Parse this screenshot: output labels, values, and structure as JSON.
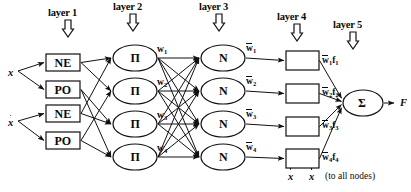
{
  "figure": {
    "type": "neural-network-diagram",
    "width": 411,
    "height": 192,
    "background": "#ffffff",
    "stroke": "#111111"
  },
  "layer_labels": [
    {
      "text": "layer 1",
      "x": 48,
      "y": 8,
      "arrow_x": 68,
      "arrow_y": 20
    },
    {
      "text": "layer 2",
      "x": 113,
      "y": 2,
      "arrow_x": 133,
      "arrow_y": 14
    },
    {
      "text": "layer 3",
      "x": 199,
      "y": 2,
      "arrow_x": 219,
      "arrow_y": 14
    },
    {
      "text": "layer 4",
      "x": 277,
      "y": 12,
      "arrow_x": 297,
      "arrow_y": 24
    },
    {
      "text": "layer 5",
      "x": 333,
      "y": 20,
      "arrow_x": 353,
      "arrow_y": 32
    }
  ],
  "inputs": [
    {
      "name": "x",
      "label": "x",
      "dot": false,
      "x": 8,
      "y": 68
    },
    {
      "name": "xdot",
      "label": "x",
      "dot": true,
      "x": 8,
      "y": 118
    }
  ],
  "layer1": {
    "name": "fuzzification-layer",
    "node_shape": "rect",
    "nodes": [
      {
        "label": "NE",
        "x": 46,
        "y": 54,
        "w": 34,
        "h": 17
      },
      {
        "label": "PO",
        "x": 46,
        "y": 81,
        "w": 34,
        "h": 17
      },
      {
        "label": "NE",
        "x": 46,
        "y": 105,
        "w": 34,
        "h": 17
      },
      {
        "label": "PO",
        "x": 46,
        "y": 132,
        "w": 34,
        "h": 17
      }
    ]
  },
  "layer2": {
    "name": "rule-product-layer",
    "node_shape": "ellipse",
    "node_label": "Π",
    "nodes": [
      {
        "label": "Π",
        "cx": 135,
        "cy": 58,
        "rx": 22,
        "ry": 13
      },
      {
        "label": "Π",
        "cx": 135,
        "cy": 91,
        "rx": 22,
        "ry": 13
      },
      {
        "label": "Π",
        "cx": 135,
        "cy": 124,
        "rx": 22,
        "ry": 13
      },
      {
        "label": "Π",
        "cx": 135,
        "cy": 157,
        "rx": 22,
        "ry": 13
      }
    ],
    "weights": [
      {
        "base": "w",
        "sub": "1",
        "x": 157,
        "y": 45
      },
      {
        "base": "w",
        "sub": "2",
        "x": 157,
        "y": 78
      },
      {
        "base": "w",
        "sub": "3",
        "x": 157,
        "y": 111
      },
      {
        "base": "w",
        "sub": "4",
        "x": 157,
        "y": 144
      }
    ]
  },
  "layer3": {
    "name": "normalization-layer",
    "node_shape": "ellipse",
    "node_label": "N",
    "nodes": [
      {
        "label": "N",
        "cx": 223,
        "cy": 58,
        "rx": 22,
        "ry": 13
      },
      {
        "label": "N",
        "cx": 223,
        "cy": 91,
        "rx": 22,
        "ry": 13
      },
      {
        "label": "N",
        "cx": 223,
        "cy": 124,
        "rx": 22,
        "ry": 13
      },
      {
        "label": "N",
        "cx": 223,
        "cy": 157,
        "rx": 22,
        "ry": 13
      }
    ],
    "weights": [
      {
        "base": "w",
        "sub": "1",
        "bar": true,
        "x": 246,
        "y": 44
      },
      {
        "base": "w",
        "sub": "2",
        "bar": true,
        "x": 246,
        "y": 77
      },
      {
        "base": "w",
        "sub": "3",
        "bar": true,
        "x": 246,
        "y": 110
      },
      {
        "base": "w",
        "sub": "4",
        "bar": true,
        "x": 246,
        "y": 143
      }
    ]
  },
  "layer4": {
    "name": "defuzzification-layer",
    "node_shape": "rect",
    "nodes": [
      {
        "x": 286,
        "y": 51,
        "w": 33,
        "h": 19
      },
      {
        "x": 286,
        "y": 84,
        "w": 33,
        "h": 19
      },
      {
        "x": 286,
        "y": 117,
        "w": 33,
        "h": 19
      },
      {
        "x": 286,
        "y": 149,
        "w": 33,
        "h": 19
      }
    ],
    "outputs": [
      {
        "base": "w",
        "sub": "1",
        "fn": "f",
        "fsub": "1",
        "bar": true,
        "x": 322,
        "y": 56
      },
      {
        "base": "w",
        "sub": "2",
        "fn": "f",
        "fsub": "2",
        "bar": true,
        "x": 322,
        "y": 88
      },
      {
        "base": "w",
        "sub": "3",
        "fn": "f",
        "fsub": "3",
        "bar": true,
        "x": 322,
        "y": 121
      },
      {
        "base": "w",
        "sub": "4",
        "fn": "f",
        "fsub": "4",
        "bar": true,
        "x": 322,
        "y": 153
      }
    ],
    "feed_inputs": [
      {
        "label": "x",
        "dot": false,
        "x": 288,
        "y": 172
      },
      {
        "label": "x",
        "dot": true,
        "x": 309,
        "y": 172
      }
    ],
    "note": "(to all nodes)",
    "note_x": 325,
    "note_y": 172
  },
  "layer5": {
    "name": "summation-layer",
    "node_shape": "ellipse",
    "node_label": "Σ",
    "node": {
      "cx": 363,
      "cy": 103,
      "rx": 20,
      "ry": 13
    },
    "output": {
      "label": "F",
      "x": 400,
      "y": 98
    }
  }
}
